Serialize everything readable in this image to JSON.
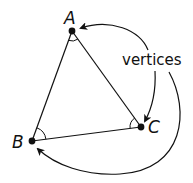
{
  "diagram": {
    "type": "triangle-vertices",
    "stroke_color": "#111111",
    "background": "#ffffff",
    "vertices": [
      {
        "label": "A",
        "x": 72,
        "y": 31
      },
      {
        "label": "B",
        "x": 32,
        "y": 141
      },
      {
        "label": "C",
        "x": 141,
        "y": 127
      }
    ],
    "edges": [
      {
        "from": "A",
        "to": "B"
      },
      {
        "from": "B",
        "to": "C"
      },
      {
        "from": "C",
        "to": "A"
      }
    ],
    "angle_marks": [
      "A",
      "B",
      "C"
    ],
    "annotation": {
      "text": "vertices",
      "arrows_to": [
        "A",
        "C",
        "B"
      ]
    }
  }
}
